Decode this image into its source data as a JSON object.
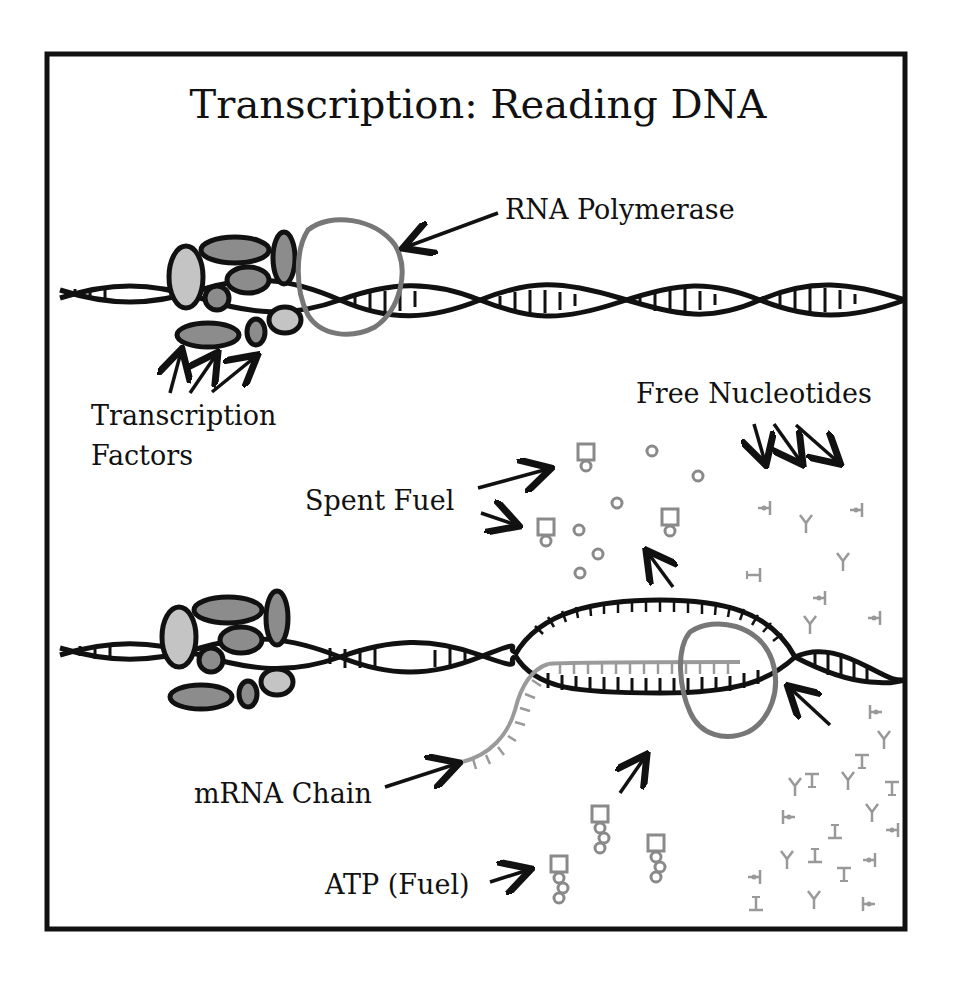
{
  "diagram": {
    "title": "Transcription: Reading DNA",
    "labels": {
      "rna_polymerase": "RNA Polymerase",
      "transcription_factors_line1": "Transcription",
      "transcription_factors_line2": "Factors",
      "free_nucleotides": "Free Nucleotides",
      "spent_fuel": "Spent Fuel",
      "mrna_chain": "mRNA Chain",
      "atp_fuel": "ATP (Fuel)"
    },
    "colors": {
      "frame": "#111111",
      "dna_strand": "#111111",
      "polymerase": "#777777",
      "factor_dark": "#8c8c8c",
      "factor_light": "#c4c4c4",
      "mrna": "#9a9a9a",
      "nucleotide": "#9a9a9a",
      "atp": "#8a8a8a"
    },
    "sections": [
      {
        "name": "initiation",
        "description": "Transcription factors and RNA polymerase bound to DNA double helix"
      },
      {
        "name": "elongation",
        "description": "DNA unwound into a transcription bubble; RNA polymerase builds mRNA from free nucleotides using ATP"
      }
    ]
  }
}
